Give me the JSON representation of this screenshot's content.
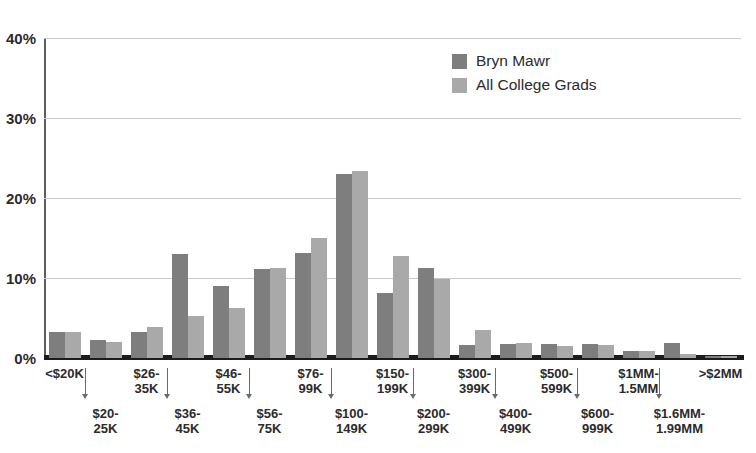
{
  "chart_data": {
    "type": "bar",
    "title": "",
    "xlabel": "",
    "ylabel": "",
    "ylim": [
      0,
      40
    ],
    "ytick_labels": [
      "0%",
      "10%",
      "20%",
      "30%",
      "40%"
    ],
    "ytick_values": [
      0,
      10,
      20,
      30,
      40
    ],
    "grid": true,
    "legend_position": "top-right",
    "categories": [
      "<$20K",
      "$20-\n25K",
      "$26-\n35K",
      "$36-\n45K",
      "$46-\n55K",
      "$56-\n75K",
      "$76-\n99K",
      "$100-\n149K",
      "$150-\n199K",
      "$200-\n299K",
      "$300-\n399K",
      "$400-\n499K",
      "$500-\n599K",
      "$600-\n999K",
      "$1MM-\n1.5MM",
      "$1.6MM-\n1.99MM",
      ">$2MM"
    ],
    "category_lines": [
      [
        "<$20K",
        ""
      ],
      [
        "$20-",
        "25K"
      ],
      [
        "$26-",
        "35K"
      ],
      [
        "$36-",
        "45K"
      ],
      [
        "$46-",
        "55K"
      ],
      [
        "$56-",
        "75K"
      ],
      [
        "$76-",
        "99K"
      ],
      [
        "$100-",
        "149K"
      ],
      [
        "$150-",
        "199K"
      ],
      [
        "$200-",
        "299K"
      ],
      [
        "$300-",
        "399K"
      ],
      [
        "$400-",
        "499K"
      ],
      [
        "$500-",
        "599K"
      ],
      [
        "$600-",
        "999K"
      ],
      [
        "$1MM-",
        "1.5MM"
      ],
      [
        "$1.6MM-",
        "1.99MM"
      ],
      [
        ">$2MM",
        ""
      ]
    ],
    "series": [
      {
        "name": "Bryn Mawr",
        "color": "#7e7e7e",
        "values": [
          3.2,
          2.3,
          3.2,
          13.0,
          9.0,
          11.1,
          13.1,
          23.0,
          8.1,
          11.3,
          1.6,
          1.8,
          1.7,
          1.7,
          0.9,
          1.9,
          0.2
        ]
      },
      {
        "name": "All College Grads",
        "color": "#a9a9a9",
        "values": [
          3.2,
          2.0,
          3.9,
          5.2,
          6.3,
          11.3,
          15.0,
          23.4,
          12.7,
          9.9,
          3.5,
          1.9,
          1.5,
          1.6,
          0.9,
          0.5,
          0.2
        ]
      }
    ]
  },
  "legend": {
    "items": [
      {
        "label": "Bryn Mawr",
        "color": "#7e7e7e"
      },
      {
        "label": "All College Grads",
        "color": "#a9a9a9"
      }
    ]
  },
  "axis": {
    "y_ticks": [
      "40%",
      "30%",
      "20%",
      "10%",
      "0%"
    ]
  }
}
